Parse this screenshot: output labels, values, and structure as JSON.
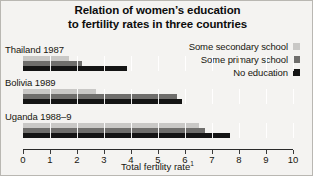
{
  "title": {
    "line1": "Relation of women’s education",
    "line2": "to fertility rates in three countries"
  },
  "axis": {
    "title": "Total fertility rate",
    "footnote_marker": "1",
    "ticks": [
      "0",
      "1",
      "2",
      "3",
      "4",
      "5",
      "6",
      "7",
      "8",
      "9",
      "10"
    ]
  },
  "legend": {
    "items": [
      {
        "label": "Some secondary school",
        "color": "#c9c8c6"
      },
      {
        "label": "Some primary school",
        "color": "#6f6e6c"
      },
      {
        "label": "No education",
        "color": "#141414"
      }
    ]
  },
  "chart_data": {
    "type": "bar",
    "orientation": "horizontal",
    "title": "Relation of women’s education to fertility rates in three countries",
    "xlabel": "Total fertility rate",
    "ylabel": "",
    "xlim": [
      0,
      10
    ],
    "grid": true,
    "legend_position": "top-right",
    "categories": [
      "Thailand 1987",
      "Bolivia 1989",
      "Uganda 1988–9"
    ],
    "series": [
      {
        "name": "Some secondary school",
        "color": "#c9c8c6",
        "values": [
          1.7,
          2.7,
          6.5
        ]
      },
      {
        "name": "Some primary school",
        "color": "#6f6e6c",
        "values": [
          2.2,
          5.7,
          6.75
        ]
      },
      {
        "name": "No education",
        "color": "#141414",
        "values": [
          3.85,
          5.9,
          7.65
        ]
      }
    ]
  }
}
